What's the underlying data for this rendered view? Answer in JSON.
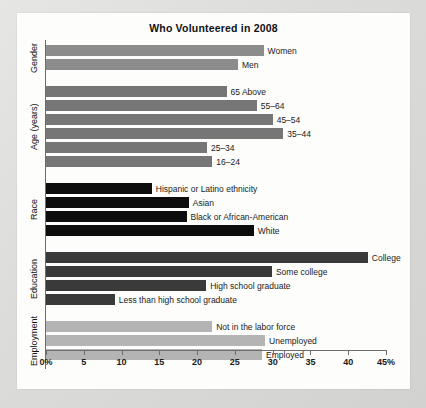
{
  "card": {
    "title": "Who Volunteered in 2008"
  },
  "chart_data": {
    "type": "bar",
    "orientation": "horizontal",
    "title": "Who Volunteered in 2008",
    "xlabel": "",
    "ylabel": "",
    "xlim": [
      0,
      45
    ],
    "grid": false,
    "legend": "none",
    "tick_labels": [
      "0%",
      "5",
      "10",
      "15",
      "20",
      "25",
      "30",
      "35",
      "40",
      "45%"
    ],
    "tick_values": [
      0,
      5,
      10,
      15,
      20,
      25,
      30,
      35,
      40,
      45
    ],
    "groups": [
      {
        "name": "Gender",
        "color": "#8c8c8c",
        "bars": [
          {
            "label": "Women",
            "value": 28.8
          },
          {
            "label": "Men",
            "value": 25.4
          }
        ]
      },
      {
        "name": "Age (years)",
        "color": "#767676",
        "bars": [
          {
            "label": "65 Above",
            "value": 23.9
          },
          {
            "label": "55–64",
            "value": 27.9
          },
          {
            "label": "45–54",
            "value": 30.0
          },
          {
            "label": "35–44",
            "value": 31.4
          },
          {
            "label": "25–34",
            "value": 21.3
          },
          {
            "label": "16–24",
            "value": 22.0
          }
        ]
      },
      {
        "name": "Race",
        "color": "#0d0d0d",
        "bars": [
          {
            "label": "Hispanic or Latino ethnicity",
            "value": 14.0
          },
          {
            "label": "Asian",
            "value": 18.9
          },
          {
            "label": "Black or African-American",
            "value": 18.6
          },
          {
            "label": "White",
            "value": 27.5
          }
        ]
      },
      {
        "name": "Education",
        "color": "#3a3a3a",
        "bars": [
          {
            "label": "College",
            "value": 42.6
          },
          {
            "label": "Some college",
            "value": 29.9
          },
          {
            "label": "High school graduate",
            "value": 21.2
          },
          {
            "label": "Less than high school graduate",
            "value": 9.1
          }
        ]
      },
      {
        "name": "Employment",
        "color": "#b4b4b4",
        "bars": [
          {
            "label": "Not in the labor force",
            "value": 22.0
          },
          {
            "label": "Unemployed",
            "value": 29.0
          },
          {
            "label": "Employed",
            "value": 28.6
          }
        ]
      }
    ]
  }
}
